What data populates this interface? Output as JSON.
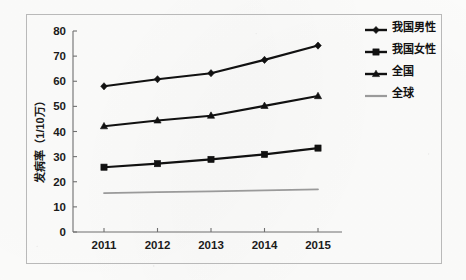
{
  "chart_data": {
    "type": "line",
    "title": "",
    "xlabel": "",
    "ylabel": "发病率（1/10万）",
    "categories": [
      "2011",
      "2012",
      "2013",
      "2014",
      "2015"
    ],
    "x_tick_labels": [
      "2011",
      "2012",
      "2013",
      "2014",
      "2015"
    ],
    "y_tick_labels": [
      "0",
      "10",
      "20",
      "30",
      "40",
      "50",
      "60",
      "70",
      "80"
    ],
    "y_ticks": [
      0,
      10,
      20,
      30,
      40,
      50,
      60,
      70,
      80
    ],
    "ylim": [
      0,
      80
    ],
    "grid": false,
    "legend_position": "right",
    "series": [
      {
        "name": "我国男性",
        "marker": "diamond",
        "color": "#111111",
        "values": [
          58.0,
          60.8,
          63.2,
          68.5,
          74.2
        ]
      },
      {
        "name": "我国女性",
        "marker": "square",
        "color": "#111111",
        "values": [
          25.8,
          27.2,
          28.9,
          30.9,
          33.4
        ]
      },
      {
        "name": "全国",
        "marker": "triangle",
        "color": "#111111",
        "values": [
          42.1,
          44.4,
          46.3,
          50.2,
          54.1
        ]
      },
      {
        "name": "全球",
        "marker": "none",
        "color": "#9a9a9a",
        "values": [
          15.5,
          15.9,
          16.2,
          16.6,
          17.0
        ]
      }
    ]
  },
  "legend": {
    "items": [
      {
        "label": "我国男性",
        "marker": "diamond",
        "color": "#111111"
      },
      {
        "label": "我国女性",
        "marker": "square",
        "color": "#111111"
      },
      {
        "label": "全国",
        "marker": "triangle",
        "color": "#111111"
      },
      {
        "label": "全球",
        "marker": "none",
        "color": "#9a9a9a"
      }
    ]
  }
}
